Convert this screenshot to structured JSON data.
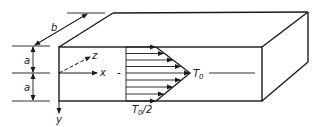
{
  "diagram": {
    "type": "3D slab with linear temperature profile",
    "colors": {
      "stroke": "#1a1a1a",
      "background": "#ffffff"
    },
    "dimensions": {
      "width_label": "b",
      "half_thickness_labels": [
        "a",
        "a"
      ]
    },
    "axes": {
      "x_label": "x",
      "y_label": "y",
      "z_label": "z"
    },
    "profile": {
      "peak_label_main": "T",
      "peak_label_sub": "0",
      "edge_label_main": "T",
      "edge_label_sub": "0",
      "edge_label_suffix": "/2",
      "minus_sign": "-",
      "arrow_count": 9
    }
  }
}
